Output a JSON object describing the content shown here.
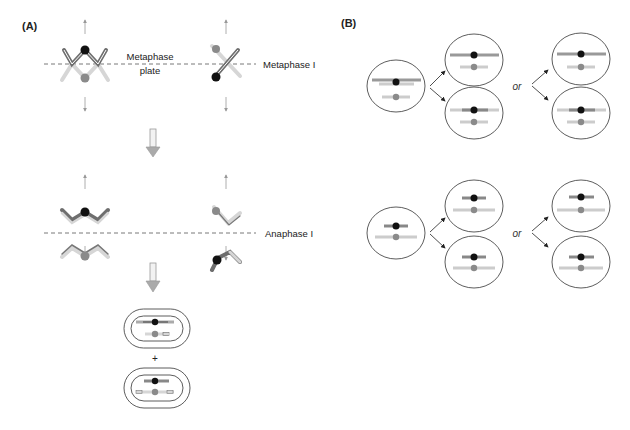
{
  "panels": {
    "a": {
      "label": "(A)",
      "metaphase_plate_label_line1": "Metaphase",
      "metaphase_plate_label_line2": "plate",
      "stage1_label": "Metaphase I",
      "stage2_label": "Anaphase I",
      "plus": "+"
    },
    "b": {
      "label": "(B)",
      "or_top": "or",
      "or_bottom": "or"
    }
  },
  "colors": {
    "black_centromere": "#111111",
    "gray_centromere": "#8a8a8a",
    "chromatid_dark": "#6e6e6e",
    "chromatid_light": "#cfcfcf",
    "arrow_gray": "#9a9a9a",
    "outline": "#333333"
  }
}
